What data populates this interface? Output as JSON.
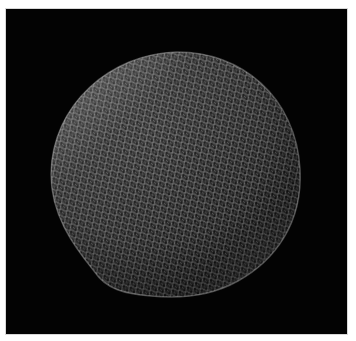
{
  "image": {
    "subject": "SEM micrograph of a spherical specimen with a regular hexagonal honeycomb surface texture",
    "alt": "Grayscale scanning electron micrograph of a faceted sphere on a black background",
    "colors": {
      "background": "#030303",
      "border": "#ffffff",
      "highlight": "#e6e6e6",
      "midtone": "#7a7a7a",
      "shadow": "#1a1a1a"
    }
  }
}
